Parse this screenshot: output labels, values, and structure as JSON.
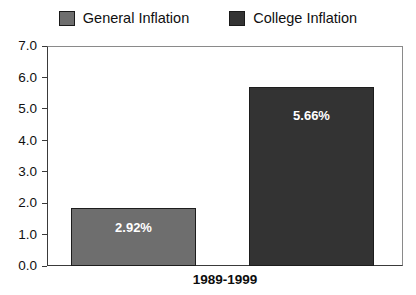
{
  "chart_data": {
    "type": "bar",
    "title": "",
    "xlabel": "1989-1999",
    "ylabel": "",
    "categories": [
      "1989-1999"
    ],
    "ylim": [
      0.0,
      7.0
    ],
    "ytick_step": 1.0,
    "ytick_labels": [
      "7.0",
      "6.0",
      "5.0",
      "4.0",
      "3.0",
      "2.0",
      "1.0",
      "0.0"
    ],
    "ytick_values": [
      7.0,
      6.0,
      5.0,
      4.0,
      3.0,
      2.0,
      1.0,
      0.0
    ],
    "grid": false,
    "legend_position": "top-center",
    "series": [
      {
        "name": "General Inflation",
        "values": [
          2.92
        ],
        "value_labels": [
          "2.92%"
        ],
        "color": "#6e6e6e",
        "border_color": "#1d1d1d",
        "bar_left_px": 70,
        "bar_width_px": 125,
        "bar_top_px": 207
      },
      {
        "name": "College Inflation",
        "values": [
          5.66
        ],
        "value_labels": [
          "5.66%"
        ],
        "color": "#333333",
        "border_color": "#1d1d1d",
        "bar_left_px": 248,
        "bar_width_px": 125,
        "bar_top_px": 86
      }
    ]
  },
  "legend": {
    "entries": [
      {
        "label": "General Inflation",
        "color": "#6e6e6e"
      },
      {
        "label": "College Inflation",
        "color": "#333333"
      }
    ]
  },
  "axis": {
    "x_title": "1989-1999"
  },
  "colors": {
    "general_inflation": "#6e6e6e",
    "college_inflation": "#333333",
    "frame": "#8a8a8a",
    "axis_line": "#3a3a3a",
    "text": "#101010",
    "value_text": "#ffffff",
    "background": "#ffffff"
  }
}
